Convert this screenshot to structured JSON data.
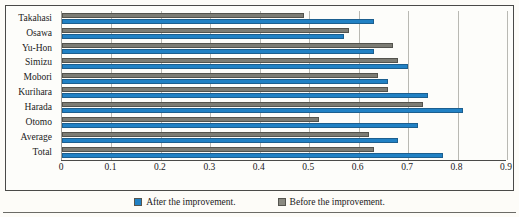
{
  "chart_data": {
    "type": "bar",
    "orientation": "horizontal",
    "title": "",
    "xlabel": "",
    "ylabel": "",
    "xlim": [
      0,
      0.9
    ],
    "xticks": [
      "0",
      "0.1",
      "0.2",
      "0.3",
      "0.4",
      "0.5",
      "0.6",
      "0.7",
      "0.8",
      "0.9"
    ],
    "xtick_values": [
      0,
      0.1,
      0.2,
      0.3,
      0.4,
      0.5,
      0.6,
      0.7,
      0.8,
      0.9
    ],
    "grid": true,
    "grid_axis": "x",
    "legend_position": "bottom",
    "categories": [
      "Takahasi",
      "Osawa",
      "Yu-Hon",
      "Simizu",
      "Mobori",
      "Kurihara",
      "Harada",
      "Otomo",
      "Average",
      "Total"
    ],
    "series": [
      {
        "name": "After the improvement.",
        "color": "#2181c4",
        "values": [
          0.63,
          0.57,
          0.63,
          0.7,
          0.66,
          0.74,
          0.81,
          0.72,
          0.68,
          0.77
        ]
      },
      {
        "name": "Before the improvement.",
        "color": "#7c7c74",
        "values": [
          0.49,
          0.58,
          0.67,
          0.68,
          0.64,
          0.66,
          0.73,
          0.52,
          0.62,
          0.63
        ]
      }
    ]
  },
  "legend": {
    "items": [
      {
        "label": "After the improvement.",
        "swatch": "legend-swatch-after"
      },
      {
        "label": "Before the improvement.",
        "swatch": "legend-swatch-before"
      }
    ]
  },
  "colors": {
    "after": "#2181c4",
    "before": "#7c7c74",
    "frame": "#4a4a48",
    "grid": "#b9b9b3",
    "page_background": "#fdfcf8"
  }
}
